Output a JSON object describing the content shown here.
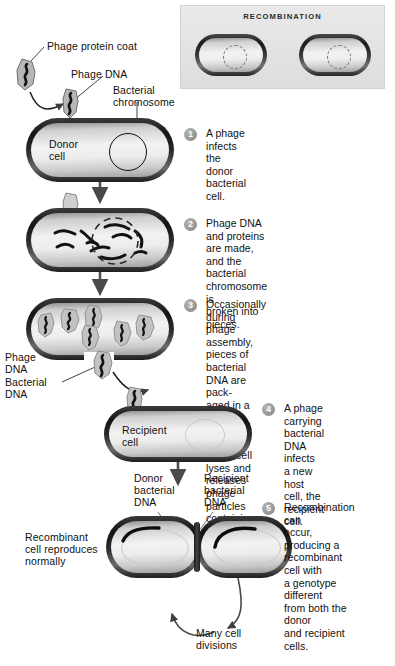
{
  "figure": {
    "inset": {
      "title": "RECOMBINATION"
    }
  },
  "labels": {
    "phage_protein_coat": "Phage protein coat",
    "phage_dna": "Phage DNA",
    "bacterial_chromosome_l1": "Bacterial",
    "bacterial_chromosome_l2": "chromosome",
    "donor_cell_l1": "Donor",
    "donor_cell_l2": "cell",
    "phage_dna_side_l1": "Phage",
    "phage_dna_side_l2": "DNA",
    "bacterial_dna_side_l1": "Bacterial",
    "bacterial_dna_side_l2": "DNA",
    "recipient_cell_l1": "Recipient",
    "recipient_cell_l2": "cell",
    "donor_bacterial_dna_l1": "Donor",
    "donor_bacterial_dna_l2": "bacterial",
    "donor_bacterial_dna_l3": "DNA",
    "recipient_bacterial_dna_l1": "Recipient",
    "recipient_bacterial_dna_l2": "bacterial",
    "recipient_bacterial_dna_l3": "DNA",
    "recombinant_l1": "Recombinant",
    "recombinant_l2": "cell reproduces",
    "recombinant_l3": "normally",
    "many_cell_divisions_l1": "Many cell",
    "many_cell_divisions_l2": "divisions"
  },
  "steps": [
    {
      "number": "1",
      "lines": [
        "A phage infects the",
        "donor bacterial cell."
      ]
    },
    {
      "number": "2",
      "lines": [
        "Phage DNA and proteins are made,",
        "and the bacterial chromosome is",
        "broken into pieces."
      ]
    },
    {
      "number": "3",
      "lines": [
        "Occasionally during phage assembly,",
        "pieces of bacterial DNA are pack-",
        "aged in a phage capsid. Then the",
        "donor cell lyses and releases phage",
        "particles containing bacterial DNA."
      ]
    },
    {
      "number": "4",
      "lines": [
        "A phage carrying",
        "bacterial DNA infects",
        "a new host cell, the",
        "recipient cell."
      ]
    },
    {
      "number": "5",
      "lines": [
        "Recombination can",
        "occur, producing a",
        "recombinant cell with",
        "a genotype different",
        "from both the donor",
        "and recipient cells."
      ]
    }
  ],
  "colors": {
    "background": "#ffffff",
    "text": "#111111",
    "badge": "#8f8f8f",
    "inset_background": "#e5e5e5",
    "cell_membrane": "#141414",
    "cytoplasm": "#ededed",
    "arrow": "#4a4a4a"
  }
}
